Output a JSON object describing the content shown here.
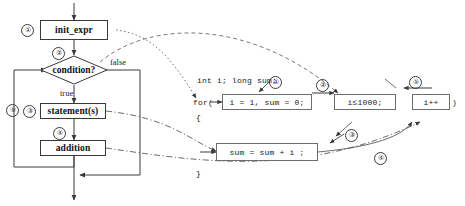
{
  "diagram": {
    "flowchart": {
      "nodes": [
        {
          "id": "init",
          "label": "init_expr",
          "marker": "①"
        },
        {
          "id": "cond",
          "label": "condition?",
          "marker": "②"
        },
        {
          "id": "stmt",
          "label": "statement(s)",
          "marker": "③"
        },
        {
          "id": "add",
          "label": "addition",
          "marker": "④"
        }
      ],
      "edge_labels": {
        "false": "false",
        "true": "true",
        "loopback": "⑤"
      }
    },
    "code": {
      "declarations": "int i;    long sum;",
      "for_keyword": "for(",
      "open_brace": "{",
      "close_brace": "}",
      "close_paren": ")",
      "init_expr": "i = 1, sum = 0;",
      "condition": "i≤1000;",
      "increment": "i++",
      "body": "sum = sum + i ;",
      "markers": {
        "init": "①",
        "condition": "②",
        "body": "③",
        "increment_link": "④",
        "loop_back": "⑤"
      }
    },
    "colors": {
      "node_border": "#3a3a3a",
      "code_border": "#6d6d6d",
      "line": "#4a4a4a",
      "text": "#111111",
      "background": "#ffffff"
    }
  }
}
